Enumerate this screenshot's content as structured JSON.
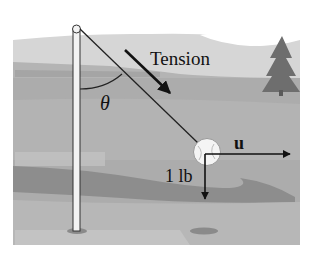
{
  "figure": {
    "labels": {
      "tension": "Tension",
      "theta": "θ",
      "u": "u",
      "weight": "1 lb"
    },
    "colors": {
      "background": "#ffffff",
      "sky": "#d9d9d9",
      "distant_hills": "#b5b5b5",
      "field": "#a9a9a9",
      "dark_band": "#8c8c8c",
      "ground_light": "#bdbdbd",
      "tree": "#6f6f6f",
      "pole": "#f2f2f2",
      "lines": "#111111"
    },
    "objects": {
      "pole": "vertical pole with rounded knob at top",
      "rope": "line from top of pole to ball",
      "ball": "baseball hanging on rope",
      "tree": "evergreen tree in background",
      "shadows": [
        "pole-base-shadow",
        "ball-shadow"
      ]
    }
  }
}
